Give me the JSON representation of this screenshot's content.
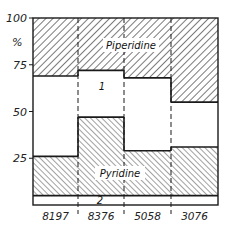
{
  "chart_data": {
    "type": "bar",
    "subtype": "stacked-100-percent-step",
    "title": "",
    "xlabel": "",
    "ylabel": "%",
    "ylim": [
      0,
      100
    ],
    "yticks": [
      "100",
      "75",
      "50",
      "25"
    ],
    "categories": [
      "8197",
      "8376",
      "5058",
      "3076"
    ],
    "series": [
      {
        "name": "2",
        "values": [
          5,
          5,
          5,
          5
        ],
        "pattern": "none"
      },
      {
        "name": "Pyridine",
        "values": [
          21,
          42,
          24,
          26
        ],
        "pattern": "hatch-fine"
      },
      {
        "name": "1",
        "values": [
          43,
          25,
          39,
          24
        ],
        "pattern": "none"
      },
      {
        "name": "Piperidine",
        "values": [
          31,
          28,
          32,
          45
        ],
        "pattern": "hatch-coarse"
      }
    ],
    "boundaries_percent": {
      "band2_top": 5,
      "pyridine_top": [
        26,
        47,
        29,
        31
      ],
      "piperidine_bottom": [
        69,
        72,
        68,
        55
      ]
    },
    "labels": {
      "piperidine": "Piperidine",
      "pyridine": "Pyridine",
      "region1": "1",
      "region2": "2"
    },
    "grid": false,
    "legend": "none (in-plot labels)"
  },
  "axis": {
    "y_unit": "%",
    "y_ticks": [
      "100",
      "75",
      "50",
      "25"
    ]
  },
  "colors": {
    "ink": "#1a1a1a",
    "background": "#ffffff"
  }
}
